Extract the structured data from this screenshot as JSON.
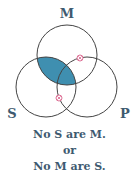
{
  "diagram": {
    "type": "venn",
    "sets": [
      {
        "id": "M",
        "label": "M"
      },
      {
        "id": "S",
        "label": "S"
      },
      {
        "id": "P",
        "label": "P"
      }
    ],
    "shaded_regions": [
      [
        "M",
        "S"
      ]
    ],
    "marked_points": [
      {
        "meaning": "existence-mark",
        "region": "M-boundary-P"
      },
      {
        "meaning": "existence-mark",
        "region": "S-boundary-P"
      }
    ],
    "colors": {
      "shade": "#3f8fb0",
      "outline": "#444444",
      "marker": "#d9608a",
      "text": "#3e5a70"
    }
  },
  "caption": {
    "line1": "No S are M.",
    "line2": "or",
    "line3": "No M are S."
  }
}
